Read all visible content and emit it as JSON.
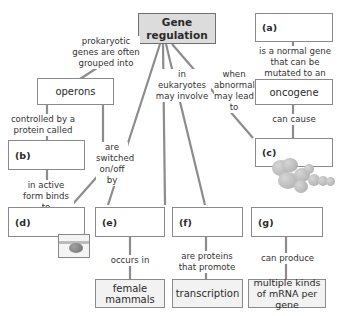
{
  "diagram": {
    "root": {
      "label": "Gene regulation",
      "line1": "Gene",
      "line2": "regulation"
    },
    "nodes": {
      "operons": "operons",
      "oncogene": "oncogene",
      "female_mammals": "female mammals",
      "transcription": "transcription",
      "mrna": "multiple kinds of mRNA per gene",
      "a": "(a)",
      "b": "(b)",
      "c": "(c)",
      "d": "(d)",
      "e": "(e)",
      "f": "(f)",
      "g": "(g)"
    },
    "links": {
      "prokaryotic": "prokaryotic genes are often grouped into",
      "eukaryotes": "in eukaryotes may involve",
      "abnormal": "when abnormal may lead to",
      "normal_gene": "is a normal gene that can be mutated to an",
      "can_cause": "can cause",
      "controlled_by": "controlled by a protein called",
      "switched": "are switched on/off by",
      "active_form": "in active form binds to",
      "occurs_in": "occurs in",
      "proteins_promote": "are proteins that promote",
      "can_produce": "can produce"
    },
    "colors": {
      "root_fill": "#dcdcdc",
      "box_border": "#8a8a8a",
      "line": "#8c8c8c",
      "term_fill": "#f2f2f2"
    }
  }
}
